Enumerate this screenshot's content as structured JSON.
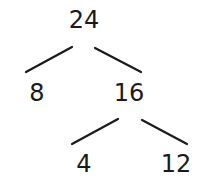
{
  "diagram": {
    "type": "factor-tree",
    "nodes": [
      {
        "id": "root",
        "label": "24",
        "x": 84,
        "y": 28
      },
      {
        "id": "left",
        "label": "8",
        "x": 37,
        "y": 101
      },
      {
        "id": "right",
        "label": "16",
        "x": 129,
        "y": 101
      },
      {
        "id": "right-left",
        "label": "4",
        "x": 84,
        "y": 172
      },
      {
        "id": "right-right",
        "label": "12",
        "x": 176,
        "y": 172
      }
    ],
    "edges": [
      {
        "from": "root",
        "to": "left",
        "x1": 72,
        "y1": 47,
        "x2": 26,
        "y2": 72
      },
      {
        "from": "root",
        "to": "right",
        "x1": 95,
        "y1": 48,
        "x2": 141,
        "y2": 72
      },
      {
        "from": "right",
        "to": "right-left",
        "x1": 118,
        "y1": 119,
        "x2": 72,
        "y2": 144
      },
      {
        "from": "right",
        "to": "right-right",
        "x1": 142,
        "y1": 120,
        "x2": 187,
        "y2": 144
      }
    ]
  }
}
